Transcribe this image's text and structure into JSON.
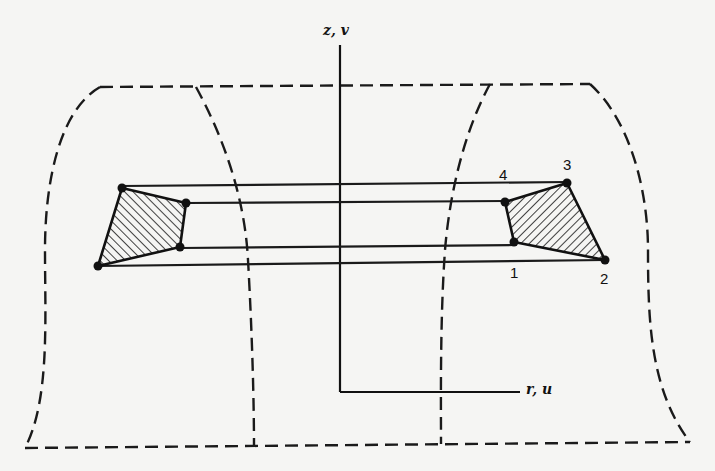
{
  "figure": {
    "axes": {
      "vertical_label": "z, v",
      "horizontal_label": "r, u"
    },
    "right_element": {
      "node_labels": [
        "1",
        "2",
        "3",
        "4"
      ],
      "nodes": {
        "1": [
          514,
          242
        ],
        "2": [
          605,
          260
        ],
        "3": [
          567,
          183
        ],
        "4": [
          505,
          202
        ]
      }
    },
    "left_element": {
      "nodes": [
        [
          122,
          188
        ],
        [
          186,
          203
        ],
        [
          180,
          247
        ],
        [
          98,
          266
        ]
      ]
    },
    "colors": {
      "ink": "#111111",
      "paper": "#f5f5f3"
    }
  }
}
